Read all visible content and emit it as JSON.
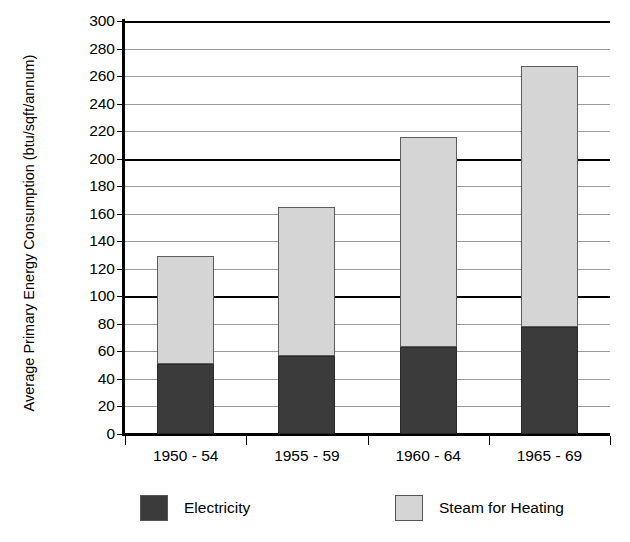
{
  "chart_data": {
    "type": "bar",
    "subtype": "stacked-column",
    "title": "",
    "xlabel": "",
    "ylabel": "Average Primary Energy Consumption (btu/sqft/annum)",
    "categories": [
      "1950 - 54",
      "1955 - 59",
      "1960 - 64",
      "1965 - 69"
    ],
    "series": [
      {
        "name": "Electricity",
        "color": "#3b3b3b",
        "values": [
          51,
          57,
          63,
          78
        ]
      },
      {
        "name": "Steam for Heating",
        "color": "#d5d5d5",
        "values": [
          78,
          108,
          153,
          189
        ]
      }
    ],
    "totals": [
      129,
      165,
      216,
      267
    ],
    "ylim": [
      0,
      300
    ],
    "ytick_step": 20,
    "yticks": [
      300,
      280,
      260,
      240,
      220,
      200,
      180,
      160,
      140,
      120,
      100,
      80,
      60,
      40,
      20,
      0
    ],
    "ytick_labels": [
      "300",
      "280",
      "260",
      "240",
      "220",
      "200",
      "180",
      "160",
      "140",
      "120",
      "100",
      "80",
      "60",
      "40",
      "20",
      "0"
    ],
    "major_gridlines": [
      300,
      200,
      100,
      0
    ],
    "grid": true,
    "grid_color": "#9a9a9a",
    "legend_position": "bottom",
    "legend": [
      "Electricity",
      "Steam for Heating"
    ],
    "background_color": "#ffffff",
    "axis_color": "#000000"
  },
  "axis": {
    "y_title": "Average Primary Energy Consumption (btu/sqft/annum)"
  },
  "legend": {
    "items": [
      {
        "label": "Electricity"
      },
      {
        "label": "Steam for Heating"
      }
    ]
  }
}
